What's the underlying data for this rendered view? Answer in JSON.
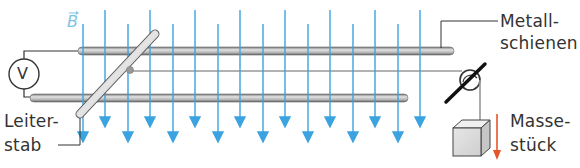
{
  "figure": {
    "field_symbol": "B",
    "field_has_vector_arrow": true,
    "labels": {
      "rails_line1": "Metall-",
      "rails_line2": "schienen",
      "rod_line1": "Leiter-",
      "rod_line2": "stab",
      "mass_line1": "Masse-",
      "mass_line2": "stück",
      "voltmeter": "V"
    },
    "components": [
      "voltmeter",
      "metal-rails",
      "conductor-rod",
      "pulley",
      "string",
      "mass",
      "magnetic-field-lines"
    ],
    "colors": {
      "field_lines": "#3ba3e0",
      "field_label": "#7ec3ea",
      "gravity_arrow": "#e8542a",
      "rails": "#a8a8a8",
      "text": "#333333"
    }
  }
}
